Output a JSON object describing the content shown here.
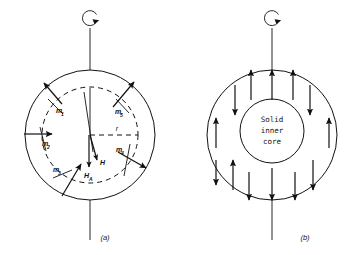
{
  "figure": {
    "background_color": "#ffffff",
    "ink_color": "#111111"
  },
  "panels": [
    {
      "id": "a",
      "caption": "(a)",
      "description": "Rotating core with randomly oriented elementary dipole moments",
      "spin_axis": {
        "rotation_icon": "rotation-arrow-icon",
        "label": ""
      },
      "outer_circle": {
        "label": ""
      },
      "inner_dashed_circle": {
        "label": ""
      },
      "radius_label": "r",
      "dipoles": [
        {
          "name": "m-1",
          "label": "m",
          "subscript": "1"
        },
        {
          "name": "m-2",
          "label": "m",
          "subscript": "2"
        },
        {
          "name": "m-3",
          "label": "m",
          "subscript": "3"
        },
        {
          "name": "m-4",
          "label": "m",
          "subscript": "4"
        },
        {
          "name": "m-5",
          "label": "m",
          "subscript": "5"
        }
      ],
      "field_vectors": [
        {
          "name": "H-vector",
          "label": "H",
          "subscript": ""
        },
        {
          "name": "HA-vector",
          "label": "H",
          "subscript": "A"
        }
      ]
    },
    {
      "id": "b",
      "caption": "(b)",
      "description": "Core with solid inner core and alternating axial flow arrows",
      "spin_axis": {
        "rotation_icon": "rotation-arrow-icon",
        "label": ""
      },
      "inner_core_label_lines": [
        "Solid",
        "inner",
        "core"
      ],
      "flow_arrows": [
        {
          "name": "flow-arrow-1",
          "direction": "up"
        },
        {
          "name": "flow-arrow-2",
          "direction": "down"
        },
        {
          "name": "flow-arrow-3",
          "direction": "up"
        },
        {
          "name": "flow-arrow-4",
          "direction": "down"
        },
        {
          "name": "flow-arrow-5",
          "direction": "up"
        },
        {
          "name": "flow-arrow-6",
          "direction": "down"
        },
        {
          "name": "flow-arrow-7",
          "direction": "up"
        },
        {
          "name": "flow-arrow-8",
          "direction": "down"
        },
        {
          "name": "flow-arrow-9",
          "direction": "up"
        },
        {
          "name": "flow-arrow-10",
          "direction": "down"
        },
        {
          "name": "flow-arrow-11",
          "direction": "up"
        },
        {
          "name": "flow-arrow-12",
          "direction": "down"
        },
        {
          "name": "flow-arrow-13",
          "direction": "down"
        }
      ]
    }
  ]
}
